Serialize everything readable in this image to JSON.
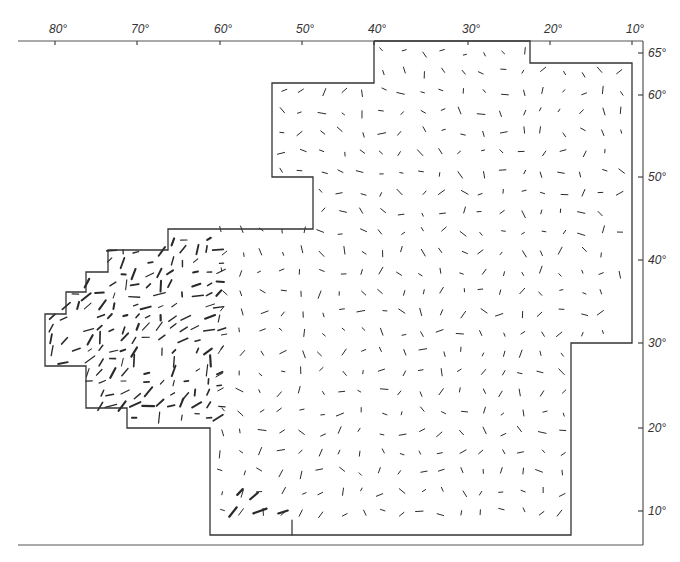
{
  "map": {
    "frame": {
      "left": 18,
      "top": 41,
      "right": 643,
      "bottom": 545
    },
    "top_axis": {
      "ticks": [
        {
          "label": "80°",
          "x": 55
        },
        {
          "label": "70°",
          "x": 137
        },
        {
          "label": "60°",
          "x": 220
        },
        {
          "label": "50°",
          "x": 302
        },
        {
          "label": "40°",
          "x": 374
        },
        {
          "label": "30°",
          "x": 468
        },
        {
          "label": "20°",
          "x": 550
        },
        {
          "label": "10°",
          "x": 632
        }
      ]
    },
    "right_axis": {
      "ticks": [
        {
          "label": "65°",
          "y": 53
        },
        {
          "label": "60°",
          "y": 95
        },
        {
          "label": "50°",
          "y": 177
        },
        {
          "label": "40°",
          "y": 260
        },
        {
          "label": "30°",
          "y": 343
        },
        {
          "label": "20°",
          "y": 428
        },
        {
          "label": "10°",
          "y": 511
        }
      ]
    },
    "region_polygon": [
      [
        374,
        41
      ],
      [
        530,
        41
      ],
      [
        530,
        63
      ],
      [
        632,
        63
      ],
      [
        632,
        343
      ],
      [
        571,
        343
      ],
      [
        571,
        535
      ],
      [
        210,
        535
      ],
      [
        210,
        428
      ],
      [
        127,
        428
      ],
      [
        127,
        408
      ],
      [
        86,
        408
      ],
      [
        86,
        366
      ],
      [
        45,
        366
      ],
      [
        45,
        314
      ],
      [
        66,
        314
      ],
      [
        66,
        292
      ],
      [
        86,
        292
      ],
      [
        86,
        272
      ],
      [
        108,
        272
      ],
      [
        108,
        250
      ],
      [
        168,
        250
      ],
      [
        168,
        229
      ],
      [
        313,
        229
      ],
      [
        313,
        177
      ],
      [
        272,
        177
      ],
      [
        272,
        83
      ],
      [
        374,
        83
      ],
      [
        374,
        41
      ]
    ],
    "vector_field": {
      "description": "Short line segments showing orientation at grid points inside region",
      "grid_spacing_x": 20,
      "grid_spacing_y": 20,
      "color": "#2a2a2a"
    }
  }
}
